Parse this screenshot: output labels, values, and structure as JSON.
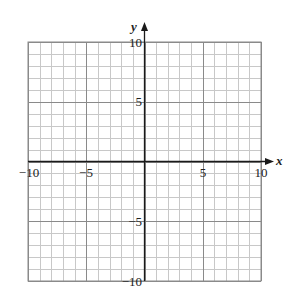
{
  "chart_data": {
    "type": "scatter",
    "title": "",
    "xlabel": "x",
    "ylabel": "y",
    "xlim": [
      -10,
      10
    ],
    "ylim": [
      -10,
      10
    ],
    "grid": true,
    "grid_step": 1,
    "major_grid_step": 5,
    "x_ticks": [
      -10,
      -5,
      5,
      10
    ],
    "x_tick_labels": [
      "−10",
      "−5",
      "5",
      "10"
    ],
    "y_ticks": [
      10,
      5,
      -5,
      -10
    ],
    "y_tick_labels": [
      "10",
      "5",
      "−5",
      "−10"
    ],
    "series": [],
    "legend": null
  },
  "labels": {
    "x_axis": "x",
    "y_axis": "y",
    "x_neg10": "−10",
    "x_neg5": "−5",
    "x_pos5": "5",
    "x_pos10": "10",
    "y_pos10": "10",
    "y_pos5": "5",
    "y_neg5": "−5",
    "y_neg10": "−10"
  },
  "colors": {
    "minor_grid": "#c8c8c8",
    "major_grid": "#8a8a8a",
    "axis": "#1a1a1a",
    "text": "#222222",
    "background": "#ffffff"
  }
}
